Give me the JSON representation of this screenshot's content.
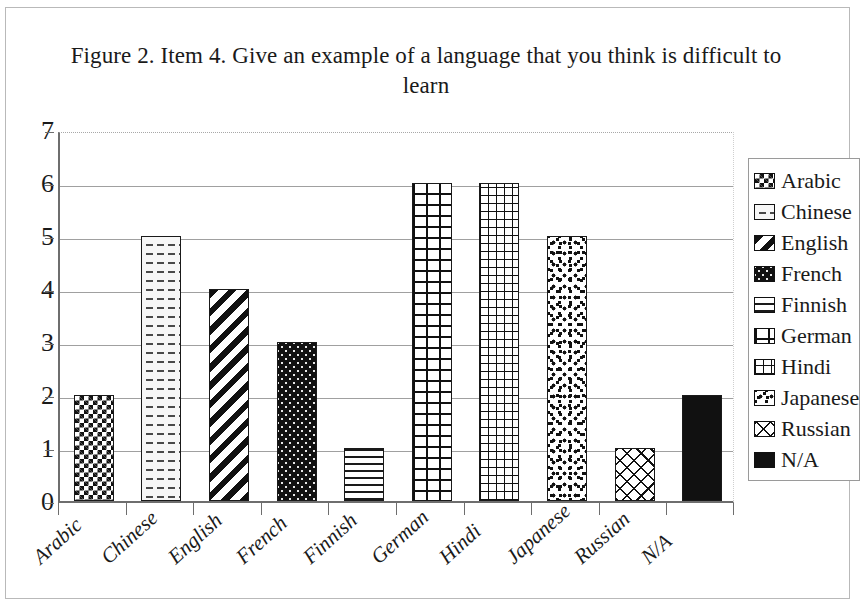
{
  "figure": {
    "title": "Figure 2. Item 4. Give an example of a language that you think is difficult to learn"
  },
  "chart_data": {
    "type": "bar",
    "title": "Figure 2. Item 4. Give an example of a language that you think is difficult to learn",
    "xlabel": "",
    "ylabel": "",
    "ylim": [
      0,
      7
    ],
    "yticks": [
      "0",
      "1",
      "2",
      "3",
      "4",
      "5",
      "6",
      "7"
    ],
    "grid": true,
    "legend_position": "right",
    "categories": [
      "Arabic",
      "Chinese",
      "English",
      "French",
      "Finnish",
      "German",
      "Hindi",
      "Japanese",
      "Russian",
      "N/A"
    ],
    "values": [
      2,
      5,
      4,
      3,
      1,
      6,
      6,
      5,
      1,
      2
    ],
    "series": [
      {
        "name": "Responses",
        "values": [
          2,
          5,
          4,
          3,
          1,
          6,
          6,
          5,
          1,
          2
        ]
      }
    ],
    "bars": [
      {
        "label": "Arabic",
        "value": 2,
        "pattern": "checkerboard"
      },
      {
        "label": "Chinese",
        "value": 5,
        "pattern": "dashed-horizontal"
      },
      {
        "label": "English",
        "value": 4,
        "pattern": "diagonal-stripes"
      },
      {
        "label": "French",
        "value": 3,
        "pattern": "dark-dotted"
      },
      {
        "label": "Finnish",
        "value": 1,
        "pattern": "horizontal-lines"
      },
      {
        "label": "German",
        "value": 6,
        "pattern": "brick"
      },
      {
        "label": "Hindi",
        "value": 6,
        "pattern": "small-grid"
      },
      {
        "label": "Japanese",
        "value": 5,
        "pattern": "confetti-dots"
      },
      {
        "label": "Russian",
        "value": 1,
        "pattern": "diagonal-crosshatch"
      },
      {
        "label": "N/A",
        "value": 2,
        "pattern": "solid-black"
      }
    ]
  },
  "legend": {
    "items": [
      {
        "label": "Arabic",
        "pattern": "checkerboard"
      },
      {
        "label": "Chinese",
        "pattern": "dashed-horizontal"
      },
      {
        "label": "English",
        "pattern": "diagonal-stripes"
      },
      {
        "label": "French",
        "pattern": "dark-dotted"
      },
      {
        "label": "Finnish",
        "pattern": "horizontal-lines"
      },
      {
        "label": "German",
        "pattern": "brick"
      },
      {
        "label": "Hindi",
        "pattern": "small-grid"
      },
      {
        "label": "Japanese",
        "pattern": "confetti-dots"
      },
      {
        "label": "Russian",
        "pattern": "diagonal-crosshatch"
      },
      {
        "label": "N/A",
        "pattern": "solid-black"
      }
    ]
  },
  "colors": {
    "ink": "#111111",
    "axis": "#6e6e6e",
    "gridline": "#a0a0a0",
    "frame": "#b9b9b9",
    "background": "#ffffff"
  }
}
